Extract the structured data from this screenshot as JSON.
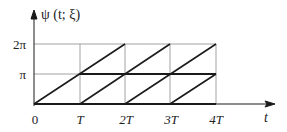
{
  "diagram": {
    "y_axis_label": "ψ (t; ξ)",
    "x_axis_label": "t",
    "x_ticks": [
      "0",
      "T",
      "2T",
      "3T",
      "4T"
    ],
    "y_ticks": [
      "π",
      "2π"
    ],
    "colors": {
      "lines": "#1a1a1a",
      "grid": "#8a8a8a",
      "background": "#ffffff"
    }
  }
}
